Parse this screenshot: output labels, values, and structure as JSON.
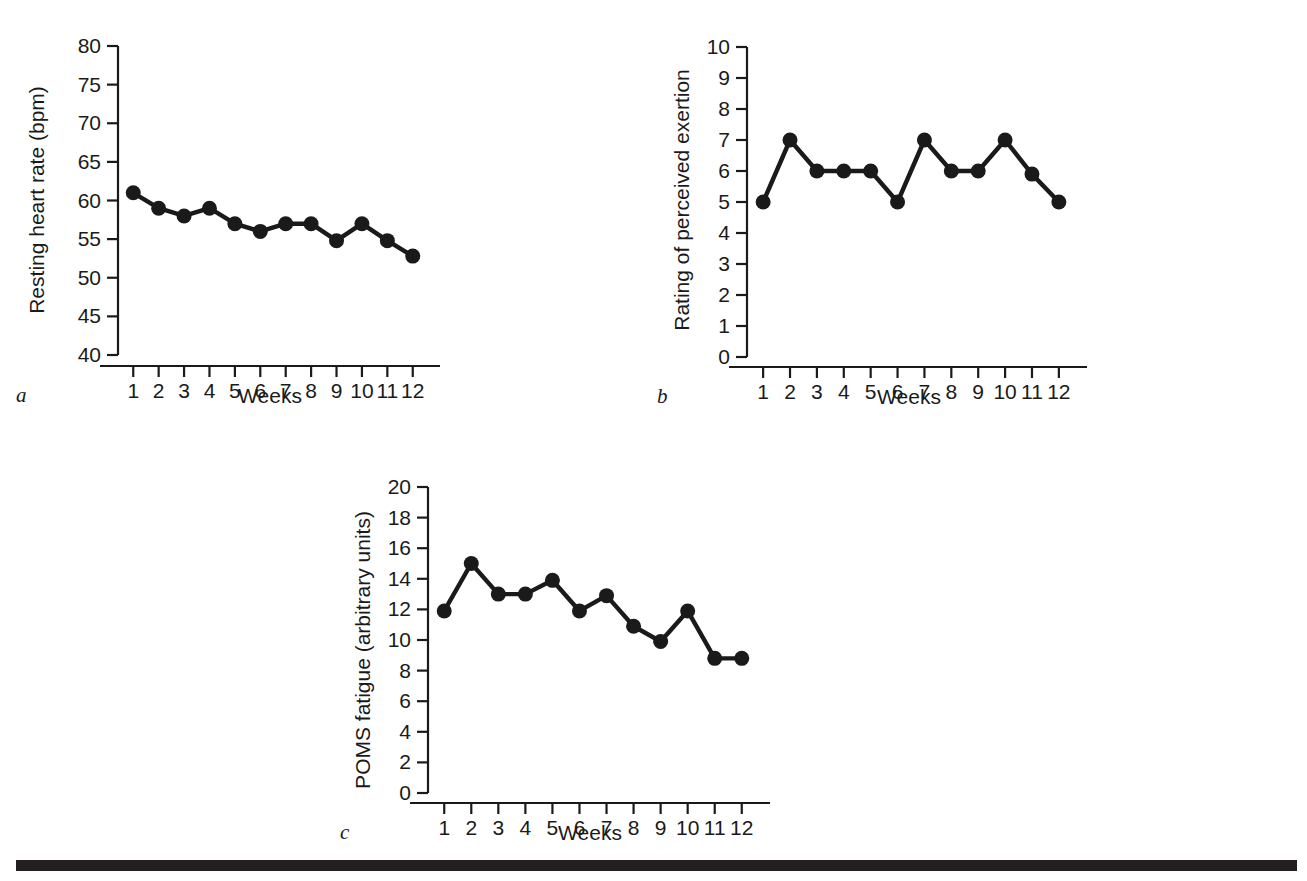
{
  "figure": {
    "background_color": "#ffffff",
    "ink_color": "#1a1a1a",
    "rule_color": "#231f20"
  },
  "panels": [
    {
      "letter": "a",
      "xlabel": "Weeks",
      "ylabel": "Resting heart rate (bpm)"
    },
    {
      "letter": "b",
      "xlabel": "Weeks",
      "ylabel": "Rating of perceived exertion"
    },
    {
      "letter": "c",
      "xlabel": "Weeks",
      "ylabel": "POMS fatigue (arbitrary units)"
    }
  ],
  "chart_data": [
    {
      "type": "line",
      "panel": "a",
      "title": "",
      "xlabel": "Weeks",
      "ylabel": "Resting heart rate (bpm)",
      "x": [
        1,
        2,
        3,
        4,
        5,
        6,
        7,
        8,
        9,
        10,
        11,
        12
      ],
      "categories": [
        "1",
        "2",
        "3",
        "4",
        "5",
        "6",
        "7",
        "8",
        "9",
        "10",
        "11",
        "12"
      ],
      "values": [
        61,
        59,
        58,
        59,
        57,
        56,
        57,
        57,
        54.8,
        57,
        54.8,
        52.8
      ],
      "xlim": [
        0.4,
        12.6
      ],
      "ylim": [
        40,
        80
      ],
      "yticks": [
        40,
        45,
        50,
        55,
        60,
        65,
        70,
        75,
        80
      ],
      "ytick_labels": [
        "40",
        "45",
        "50",
        "55",
        "60",
        "65",
        "70",
        "75",
        "80"
      ],
      "xticks": [
        1,
        2,
        3,
        4,
        5,
        6,
        7,
        8,
        9,
        10,
        11,
        12
      ],
      "xtick_labels": [
        "1",
        "2",
        "3",
        "4",
        "5",
        "6",
        "7",
        "8",
        "9",
        "10",
        "11",
        "12"
      ],
      "grid": false,
      "legend": null,
      "marker": "circle",
      "series_color": "#1a1a1a"
    },
    {
      "type": "line",
      "panel": "b",
      "title": "",
      "xlabel": "Weeks",
      "ylabel": "Rating of perceived exertion",
      "x": [
        1,
        2,
        3,
        4,
        5,
        6,
        7,
        8,
        9,
        10,
        11,
        12
      ],
      "categories": [
        "1",
        "2",
        "3",
        "4",
        "5",
        "6",
        "7",
        "8",
        "9",
        "10",
        "11",
        "12"
      ],
      "values": [
        5,
        7,
        6,
        6,
        6,
        5,
        7,
        6,
        6,
        7,
        5.9,
        5
      ],
      "xlim": [
        0.4,
        12.6
      ],
      "ylim": [
        0,
        10
      ],
      "yticks": [
        0,
        1,
        2,
        3,
        4,
        5,
        6,
        7,
        8,
        9,
        10
      ],
      "ytick_labels": [
        "0",
        "1",
        "2",
        "3",
        "4",
        "5",
        "6",
        "7",
        "8",
        "9",
        "10"
      ],
      "xticks": [
        1,
        2,
        3,
        4,
        5,
        6,
        7,
        8,
        9,
        10,
        11,
        12
      ],
      "xtick_labels": [
        "1",
        "2",
        "3",
        "4",
        "5",
        "6",
        "7",
        "8",
        "9",
        "10",
        "11",
        "12"
      ],
      "grid": false,
      "legend": null,
      "marker": "circle",
      "series_color": "#1a1a1a"
    },
    {
      "type": "line",
      "panel": "c",
      "title": "",
      "xlabel": "Weeks",
      "ylabel": "POMS fatigue (arbitrary units)",
      "x": [
        1,
        2,
        3,
        4,
        5,
        6,
        7,
        8,
        9,
        10,
        11,
        12
      ],
      "categories": [
        "1",
        "2",
        "3",
        "4",
        "5",
        "6",
        "7",
        "8",
        "9",
        "10",
        "11",
        "12"
      ],
      "values": [
        11.9,
        15,
        13,
        13,
        13.9,
        11.9,
        12.9,
        10.9,
        9.9,
        11.9,
        8.8,
        8.8
      ],
      "xlim": [
        0.4,
        12.6
      ],
      "ylim": [
        0,
        20
      ],
      "yticks": [
        0,
        2,
        4,
        6,
        8,
        10,
        12,
        14,
        16,
        18,
        20
      ],
      "ytick_labels": [
        "0",
        "2",
        "4",
        "6",
        "8",
        "10",
        "12",
        "14",
        "16",
        "18",
        "20"
      ],
      "xticks": [
        1,
        2,
        3,
        4,
        5,
        6,
        7,
        8,
        9,
        10,
        11,
        12
      ],
      "xtick_labels": [
        "1",
        "2",
        "3",
        "4",
        "5",
        "6",
        "7",
        "8",
        "9",
        "10",
        "11",
        "12"
      ],
      "grid": false,
      "legend": null,
      "marker": "circle",
      "series_color": "#1a1a1a"
    }
  ]
}
